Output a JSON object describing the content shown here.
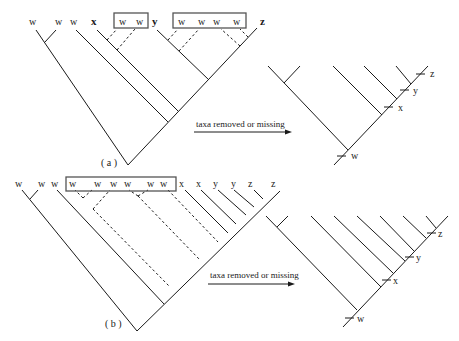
{
  "figure": {
    "panel_a": {
      "caption": "( a )",
      "input_tree": {
        "leaves": [
          "w",
          "w",
          "w",
          "x",
          "w",
          "w",
          "y",
          "w",
          "w",
          "w",
          "w",
          "z"
        ],
        "boxed_group_1": [
          "w",
          "w"
        ],
        "boxed_group_2": [
          "w",
          "w",
          "w",
          "w"
        ]
      },
      "arrow_label": "taxa removed or missing",
      "output_tree": {
        "marks": [
          "w",
          "x",
          "y",
          "z"
        ]
      }
    },
    "panel_b": {
      "caption": "( b )",
      "input_tree": {
        "leaves": [
          "w",
          "w",
          "w",
          "w",
          "w",
          "w",
          "w",
          "w",
          "w",
          "x",
          "x",
          "y",
          "y",
          "z",
          "z"
        ],
        "boxed_group": [
          "w",
          "w",
          "w",
          "w",
          "w",
          "w"
        ]
      },
      "arrow_label": "taxa removed or missing",
      "output_tree": {
        "marks": [
          "w",
          "x",
          "y",
          "z"
        ]
      }
    }
  },
  "labels": {
    "w": "w",
    "x": "x",
    "y": "y",
    "z": "z"
  }
}
